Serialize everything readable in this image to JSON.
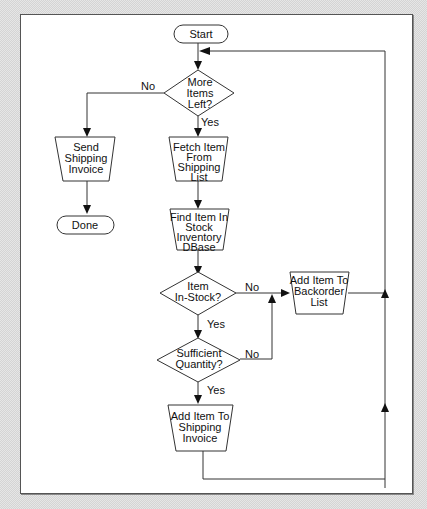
{
  "diagram": {
    "type": "flowchart",
    "nodes": {
      "start": {
        "shape": "terminator",
        "lines": [
          "Start"
        ]
      },
      "more_items": {
        "shape": "decision",
        "lines": [
          "More",
          "Items",
          "Left?"
        ]
      },
      "send_invoice": {
        "shape": "manual-operation",
        "lines": [
          "Send",
          "Shipping",
          "Invoice"
        ]
      },
      "done": {
        "shape": "terminator",
        "lines": [
          "Done"
        ]
      },
      "fetch_item": {
        "shape": "manual-operation",
        "lines": [
          "Fetch Item",
          "From",
          "Shipping",
          "List"
        ]
      },
      "find_item": {
        "shape": "manual-operation",
        "lines": [
          "Find Item In",
          "Stock",
          "Inventory",
          "DBase"
        ]
      },
      "in_stock": {
        "shape": "decision",
        "lines": [
          "Item",
          "In-Stock?"
        ]
      },
      "add_backorder": {
        "shape": "manual-operation",
        "lines": [
          "Add Item To",
          "Backorder",
          "List"
        ]
      },
      "sufficient_qty": {
        "shape": "decision",
        "lines": [
          "Sufficient",
          "Quantity?"
        ]
      },
      "add_invoice": {
        "shape": "manual-operation",
        "lines": [
          "Add Item To",
          "Shipping",
          "Invoice"
        ]
      }
    },
    "edge_labels": {
      "more_no": "No",
      "more_yes": "Yes",
      "stock_no": "No",
      "stock_yes": "Yes",
      "qty_no": "No",
      "qty_yes": "Yes"
    },
    "edges": [
      {
        "from": "start",
        "to": "more_items"
      },
      {
        "from": "more_items",
        "to": "send_invoice",
        "label": "No"
      },
      {
        "from": "more_items",
        "to": "fetch_item",
        "label": "Yes"
      },
      {
        "from": "send_invoice",
        "to": "done"
      },
      {
        "from": "fetch_item",
        "to": "find_item"
      },
      {
        "from": "find_item",
        "to": "in_stock"
      },
      {
        "from": "in_stock",
        "to": "add_backorder",
        "label": "No"
      },
      {
        "from": "in_stock",
        "to": "sufficient_qty",
        "label": "Yes"
      },
      {
        "from": "sufficient_qty",
        "to": "add_backorder",
        "label": "No"
      },
      {
        "from": "sufficient_qty",
        "to": "add_invoice",
        "label": "Yes"
      },
      {
        "from": "add_backorder",
        "to": "more_items"
      },
      {
        "from": "add_invoice",
        "to": "more_items"
      }
    ]
  }
}
